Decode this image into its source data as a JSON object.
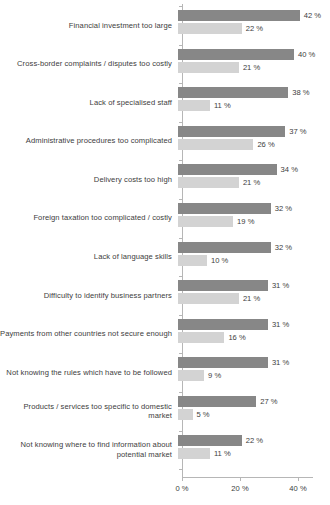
{
  "chart_data": {
    "type": "bar",
    "orientation": "horizontal",
    "title": "",
    "subtitle": "",
    "xlabel": "",
    "ylabel": "",
    "xlim": [
      0,
      45
    ],
    "grid": false,
    "legend": "none",
    "value_suffix": " %",
    "axis": {
      "ticks": [
        0,
        20,
        40
      ],
      "tick_labels": [
        "0 %",
        "20 %",
        "40 %"
      ]
    },
    "colors": {
      "series1": "#878787",
      "series2": "#d3d3d3",
      "axis": "#b6b6b6",
      "text": "#3d3d3d",
      "background": "#ffffff"
    },
    "categories": [
      "Financial investment too large",
      "Cross-border complaints / disputes too costly",
      "Lack of specialised staff",
      "Administrative procedures too complicated",
      "Delivery costs too high",
      "Foreign taxation too complicated / costly",
      "Lack of language skills",
      "Difficulty to identify business partners",
      "Payments from other countries not secure enough",
      "Not knowing the rules which have to be followed",
      "Products / services too specific to domestic market",
      "Not knowing where to find information about potential market"
    ],
    "series": [
      {
        "name": "series1",
        "values": [
          42,
          40,
          38,
          37,
          34,
          32,
          32,
          31,
          31,
          31,
          27,
          22
        ],
        "labels": [
          "42 %",
          "40 %",
          "38 %",
          "37 %",
          "34 %",
          "32 %",
          "32 %",
          "31 %",
          "31 %",
          "31 %",
          "27 %",
          "22 %"
        ]
      },
      {
        "name": "series2",
        "values": [
          22,
          21,
          11,
          26,
          21,
          19,
          10,
          21,
          16,
          9,
          5,
          11
        ],
        "labels": [
          "22 %",
          "21 %",
          "11 %",
          "26 %",
          "21 %",
          "19 %",
          "10 %",
          "21 %",
          "16 %",
          "9 %",
          "5 %",
          "11 %"
        ]
      }
    ]
  }
}
